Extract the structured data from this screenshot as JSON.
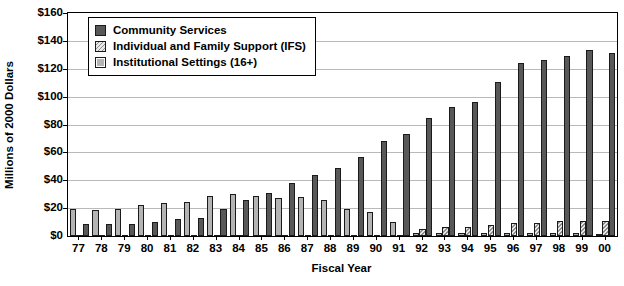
{
  "chart_data": {
    "type": "bar",
    "title": "",
    "xlabel": "Fiscal Year",
    "ylabel": "Millions of 2000 Dollars",
    "ylim": [
      0,
      160
    ],
    "ytick_step": 20,
    "ytick_labels": [
      "$0",
      "$20",
      "$40",
      "$60",
      "$80",
      "$100",
      "$120",
      "$140",
      "$160"
    ],
    "ytick_values": [
      0,
      20,
      40,
      60,
      80,
      100,
      120,
      140,
      160
    ],
    "grid": true,
    "legend_position": "top-left-inside",
    "categories": [
      "77",
      "78",
      "79",
      "80",
      "81",
      "82",
      "83",
      "84",
      "85",
      "86",
      "87",
      "88",
      "89",
      "90",
      "91",
      "92",
      "93",
      "94",
      "95",
      "96",
      "97",
      "98",
      "99",
      "00"
    ],
    "series": [
      {
        "name": "Community Services",
        "color": "#585858",
        "pattern": "solid",
        "values": [
          8.5,
          8.5,
          8.5,
          10.0,
          12.5,
          13.0,
          19.5,
          25.5,
          31.0,
          38.0,
          44.0,
          48.5,
          56.5,
          68.5,
          73.5,
          85.0,
          92.5,
          96.0,
          110.5,
          124.0,
          126.5,
          129.0,
          133.5,
          131.0
        ]
      },
      {
        "name": "Individual and Family Support (IFS)",
        "color": "#e8e8e8",
        "pattern": "diagonal-hatch",
        "values": [
          0.0,
          0.0,
          0.0,
          0.0,
          0.0,
          0.0,
          0.0,
          0.0,
          0.0,
          0.0,
          0.0,
          0.0,
          0.0,
          0.0,
          0.0,
          5.0,
          6.5,
          6.5,
          8.0,
          9.0,
          9.5,
          10.5,
          11.0,
          11.0
        ]
      },
      {
        "name": "Institutional Settings (16+)",
        "color": "#b4b4b4",
        "pattern": "solid-light",
        "values": [
          19.5,
          19.0,
          19.5,
          22.0,
          23.5,
          24.5,
          29.0,
          30.5,
          29.0,
          27.5,
          28.0,
          25.5,
          19.5,
          17.0,
          10.0,
          2.5,
          2.5,
          2.5,
          2.5,
          2.0,
          2.5,
          2.0,
          2.5,
          1.5
        ]
      }
    ]
  },
  "axes": {
    "y_title": "Millions of 2000 Dollars",
    "x_title": "Fiscal Year"
  },
  "legend": {
    "entries": [
      {
        "label": "Community Services",
        "swatch": "community"
      },
      {
        "label": "Individual and Family Support (IFS)",
        "swatch": "ifs"
      },
      {
        "label": "Institutional Settings (16+)",
        "swatch": "inst"
      }
    ]
  }
}
